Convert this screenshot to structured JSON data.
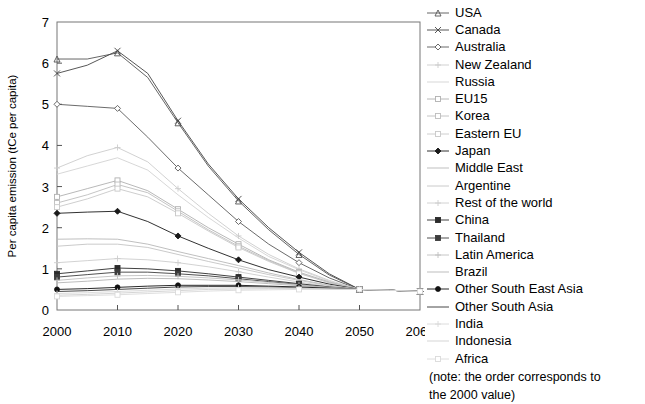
{
  "chart_data": {
    "type": "line",
    "title": "",
    "xlabel": "",
    "ylabel": "Per capita emission (tCe per capita)",
    "xlim": [
      2000,
      2060
    ],
    "ylim": [
      0,
      7
    ],
    "xticks": [
      2000,
      2010,
      2020,
      2030,
      2040,
      2050,
      2060
    ],
    "yticks": [
      0,
      1,
      2,
      3,
      4,
      5,
      6,
      7
    ],
    "grid": false,
    "legend_position": "right",
    "x": [
      2000,
      2005,
      2010,
      2015,
      2020,
      2025,
      2030,
      2035,
      2040,
      2045,
      2050,
      2055,
      2060
    ],
    "note": [
      "(note: the order  corresponds to",
      "the 2000 value)"
    ],
    "series": [
      {
        "name": "USA",
        "marker": "triangle",
        "color": "#555555",
        "values": [
          6.1,
          6.1,
          6.25,
          5.65,
          4.55,
          3.5,
          2.65,
          1.95,
          1.35,
          0.85,
          0.5,
          0.48,
          0.45
        ]
      },
      {
        "name": "Canada",
        "marker": "cross",
        "color": "#444444",
        "values": [
          5.75,
          5.95,
          6.3,
          5.75,
          4.6,
          3.55,
          2.7,
          2.0,
          1.4,
          0.88,
          0.5,
          0.48,
          0.45
        ]
      },
      {
        "name": "Australia",
        "marker": "diamond-open",
        "color": "#5a5a5a",
        "values": [
          5.0,
          4.95,
          4.9,
          4.2,
          3.45,
          2.8,
          2.15,
          1.6,
          1.15,
          0.78,
          0.5,
          0.48,
          0.45
        ]
      },
      {
        "name": "New Zealand",
        "marker": "plus",
        "color": "#cccccc",
        "values": [
          3.45,
          3.75,
          3.95,
          3.6,
          2.95,
          2.35,
          1.8,
          1.35,
          1.0,
          0.72,
          0.5,
          0.48,
          0.45
        ]
      },
      {
        "name": "Russia",
        "marker": "none",
        "color": "#d2d2d2",
        "values": [
          3.3,
          3.5,
          3.7,
          3.4,
          2.8,
          2.25,
          1.75,
          1.3,
          0.98,
          0.7,
          0.5,
          0.48,
          0.45
        ]
      },
      {
        "name": "EU15",
        "marker": "square",
        "color": "#b0b0b0",
        "values": [
          2.75,
          2.95,
          3.15,
          2.9,
          2.45,
          2.0,
          1.6,
          1.22,
          0.92,
          0.68,
          0.5,
          0.48,
          0.45
        ]
      },
      {
        "name": "Korea",
        "marker": "square",
        "color": "#bdbdbd",
        "values": [
          2.6,
          2.8,
          3.05,
          2.85,
          2.4,
          1.95,
          1.55,
          1.2,
          0.9,
          0.67,
          0.5,
          0.48,
          0.45
        ]
      },
      {
        "name": "Eastern EU",
        "marker": "square",
        "color": "#c8c8c8",
        "values": [
          2.5,
          2.7,
          2.95,
          2.75,
          2.35,
          1.92,
          1.52,
          1.18,
          0.89,
          0.66,
          0.5,
          0.48,
          0.45
        ]
      },
      {
        "name": "Japan",
        "marker": "diamond-filled",
        "color": "#1a1a1a",
        "values": [
          2.35,
          2.38,
          2.4,
          2.15,
          1.8,
          1.5,
          1.22,
          0.98,
          0.8,
          0.63,
          0.5,
          0.48,
          0.45
        ]
      },
      {
        "name": "Middle East",
        "marker": "none",
        "color": "#b8b8b8",
        "values": [
          1.72,
          1.73,
          1.72,
          1.6,
          1.42,
          1.25,
          1.08,
          0.9,
          0.74,
          0.6,
          0.5,
          0.48,
          0.45
        ]
      },
      {
        "name": "Argentine",
        "marker": "none",
        "color": "#c4c4c4",
        "values": [
          1.55,
          1.6,
          1.6,
          1.52,
          1.35,
          1.18,
          1.02,
          0.86,
          0.72,
          0.59,
          0.5,
          0.48,
          0.45
        ]
      },
      {
        "name": "Rest of the world",
        "marker": "plus",
        "color": "#cdcdcd",
        "values": [
          1.15,
          1.2,
          1.25,
          1.22,
          1.15,
          1.05,
          0.93,
          0.8,
          0.68,
          0.57,
          0.5,
          0.48,
          0.45
        ]
      },
      {
        "name": "China",
        "marker": "square-filled",
        "color": "#2b2b2b",
        "values": [
          0.88,
          0.95,
          1.02,
          1.0,
          0.95,
          0.88,
          0.8,
          0.72,
          0.64,
          0.56,
          0.5,
          0.48,
          0.45
        ]
      },
      {
        "name": "Thailand",
        "marker": "square-filled",
        "color": "#3d3d3d",
        "values": [
          0.8,
          0.86,
          0.92,
          0.92,
          0.88,
          0.83,
          0.76,
          0.69,
          0.62,
          0.55,
          0.5,
          0.48,
          0.45
        ]
      },
      {
        "name": "Latin America",
        "marker": "plus",
        "color": "#c0c0c0",
        "values": [
          0.72,
          0.78,
          0.83,
          0.84,
          0.82,
          0.78,
          0.73,
          0.67,
          0.61,
          0.55,
          0.5,
          0.48,
          0.45
        ]
      },
      {
        "name": "Brazil",
        "marker": "none",
        "color": "#b5b5b5",
        "values": [
          0.66,
          0.7,
          0.75,
          0.77,
          0.76,
          0.73,
          0.69,
          0.64,
          0.59,
          0.54,
          0.5,
          0.48,
          0.45
        ]
      },
      {
        "name": "Other South East Asia",
        "marker": "circle-filled",
        "color": "#111111",
        "values": [
          0.5,
          0.52,
          0.55,
          0.58,
          0.6,
          0.6,
          0.6,
          0.58,
          0.56,
          0.53,
          0.5,
          0.48,
          0.45
        ]
      },
      {
        "name": "Other South Asia",
        "marker": "none",
        "color": "#333333",
        "values": [
          0.45,
          0.47,
          0.5,
          0.53,
          0.56,
          0.57,
          0.57,
          0.56,
          0.54,
          0.52,
          0.5,
          0.48,
          0.45
        ]
      },
      {
        "name": "India",
        "marker": "plus",
        "color": "#d8d8d8",
        "values": [
          0.4,
          0.42,
          0.45,
          0.48,
          0.51,
          0.53,
          0.54,
          0.54,
          0.53,
          0.51,
          0.5,
          0.48,
          0.45
        ]
      },
      {
        "name": "Indonesia",
        "marker": "none",
        "color": "#d0d0d0",
        "values": [
          0.36,
          0.38,
          0.41,
          0.44,
          0.47,
          0.5,
          0.51,
          0.52,
          0.52,
          0.51,
          0.5,
          0.48,
          0.45
        ]
      },
      {
        "name": "Africa",
        "marker": "square",
        "color": "#dadada",
        "values": [
          0.33,
          0.35,
          0.37,
          0.4,
          0.43,
          0.46,
          0.48,
          0.49,
          0.5,
          0.5,
          0.5,
          0.48,
          0.45
        ]
      }
    ]
  }
}
